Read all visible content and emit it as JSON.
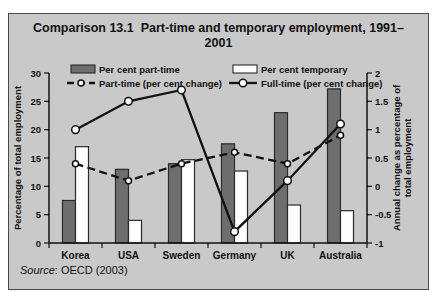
{
  "figure": {
    "title_line1": "Comparison 13.1  Part-time and temporary employment, 1991–",
    "title_line2": "2001",
    "source_prefix": "Source",
    "source_rest": ": OECD (2003)"
  },
  "chart_data": {
    "type": "bar",
    "subtype": "bar-line combo, dual axis",
    "categories": [
      "Korea",
      "USA",
      "Sweden",
      "Germany",
      "UK",
      "Australia"
    ],
    "bar_series": [
      {
        "name": "Per cent part-time",
        "axis": "left",
        "color": "#6e6e6e",
        "values": [
          7.5,
          13,
          14,
          17.5,
          23,
          27.2
        ]
      },
      {
        "name": "Per cent temporary",
        "axis": "left",
        "color": "#fdfdfd",
        "values": [
          17,
          4,
          14.7,
          12.7,
          6.7,
          5.7
        ]
      }
    ],
    "line_series": [
      {
        "name": "Part-time (per cent change)",
        "axis": "right",
        "style": "dashed",
        "values": [
          0.4,
          0.1,
          0.4,
          0.6,
          0.4,
          0.9
        ]
      },
      {
        "name": "Full-time (per cent change)",
        "axis": "right",
        "style": "solid",
        "values": [
          1.0,
          1.5,
          1.7,
          -0.8,
          0.1,
          1.1
        ]
      }
    ],
    "left_axis": {
      "label": "Percentage of total employment",
      "min": 0,
      "max": 30,
      "step": 5
    },
    "right_axis": {
      "label_line1": "Annual change as percentage of",
      "label_line2": "total employment",
      "min": -1,
      "max": 2,
      "step": 0.5
    },
    "source": "Source: OECD (2003)",
    "legend_position": "top",
    "grid": false,
    "colors": {
      "background": "#c9c9c9",
      "bar_dark": "#6e6e6e",
      "bar_light": "#fdfdfd",
      "ink": "#111111",
      "marker_fill": "#ffffff",
      "box_border": "#4a4a4a"
    }
  }
}
